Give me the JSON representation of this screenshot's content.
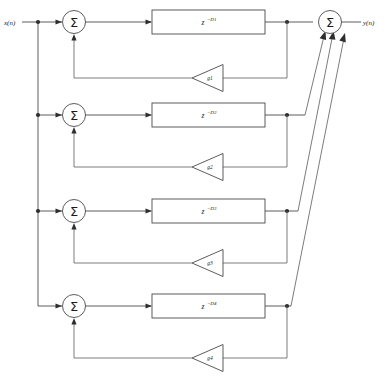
{
  "diagram": {
    "input_label": "x(n)",
    "output_label": "y(n)",
    "summation_symbol": "Σ",
    "output_summer_name": "output-summer",
    "caption": "",
    "colors": {
      "wire": "#4a4a4a",
      "node": "#2e2e2e",
      "background": "#ffffff",
      "text": "#1a1a1a"
    },
    "sections": [
      {
        "id": 1,
        "summer_symbol": "Σ",
        "delay_base": "z",
        "delay_exponent": "−D1",
        "delay_label": "z−D1",
        "gain_label": "g1"
      },
      {
        "id": 2,
        "summer_symbol": "Σ",
        "delay_base": "z",
        "delay_exponent": "−D2",
        "delay_label": "z−D2",
        "gain_label": "g2"
      },
      {
        "id": 3,
        "summer_symbol": "Σ",
        "delay_base": "z",
        "delay_exponent": "−D3",
        "delay_label": "z−D3",
        "gain_label": "g3"
      },
      {
        "id": 4,
        "summer_symbol": "Σ",
        "delay_base": "z",
        "delay_exponent": "−D4",
        "delay_label": "z−D4",
        "gain_label": "g4"
      }
    ]
  }
}
